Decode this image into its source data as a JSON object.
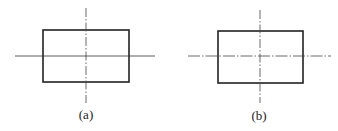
{
  "figures": [
    {
      "label": "(a)",
      "horizontal_line": "solid",
      "vertical_line": "dash-dot"
    },
    {
      "label": "(b)",
      "horizontal_line": "dash-dot",
      "vertical_line": "dash-dot"
    }
  ],
  "colors": {
    "stroke": "#222222",
    "background": "#ffffff"
  }
}
